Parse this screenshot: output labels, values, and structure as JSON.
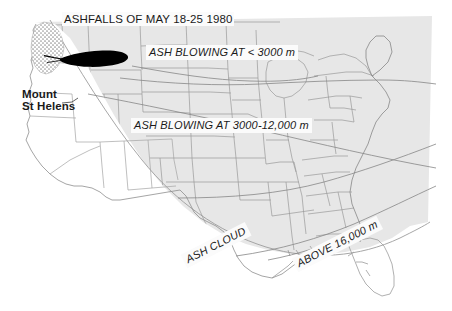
{
  "map": {
    "title": "ASHFALLS OF MAY 18-25 1980",
    "subject": "Mount St Helens 1980 eruption ashfall and ash cloud distribution over the United States",
    "background_color": "#ffffff",
    "cloud_fill_color": "#e7e7e7",
    "plume_fill_color": "#000000",
    "state_border_color": "#9a9a9a",
    "coastline_color": "#8c8c8c",
    "text_color": "#1a1a1a",
    "label_background_color": "#fbfbfb",
    "labels": {
      "title": "ASHFALLS OF MAY 18-25 1980",
      "ash_blowing_low": "ASH BLOWING AT < 3000 m",
      "ash_blowing_mid": "ASH BLOWING AT 3000-12,000 m",
      "ash_cloud": "ASH CLOUD",
      "above_16000": "ABOVE 16,000 m",
      "volcano_line1": "Mount",
      "volcano_line2": "St Helens"
    },
    "features": [
      {
        "name": "heavy-ashfall-plume",
        "description": "solid black elongated tapered ashfall lobe extending east from Mount St Helens across Washington, Idaho and into Montana"
      },
      {
        "name": "stipple-ashfall-zone",
        "description": "stippled dotted ashfall texture over western Washington and Oregon around the volcano"
      },
      {
        "name": "ash-cloud-shading",
        "description": "light grey shaded ash cloud covering the northern, central and eastern United States"
      },
      {
        "name": "ash-cloud-boundary",
        "description": "curved southwestern boundary line of the ash cloud sweeping from the Pacific Northwest down through the Southwest and along the Gulf Coast"
      },
      {
        "name": "trajectory-lines",
        "description": "thin curved ash trajectory lines crossing the central and eastern states"
      }
    ]
  }
}
